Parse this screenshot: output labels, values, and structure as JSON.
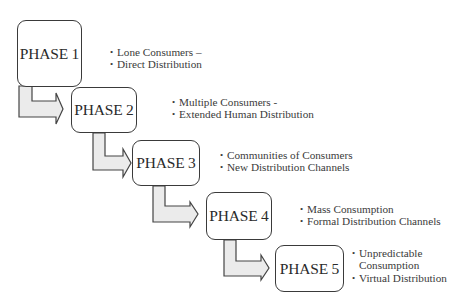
{
  "diagram": {
    "type": "staircase-process",
    "colors": {
      "box_border": "#3a3a3a",
      "box_fill": "#ffffff",
      "arrow_fill": "#ebebeb",
      "arrow_border": "#444444",
      "text": "#333333"
    },
    "phases": [
      {
        "label": "PHASE 1",
        "bullets": [
          "Lone Consumers –",
          "Direct Distribution"
        ]
      },
      {
        "label": "PHASE 2",
        "bullets": [
          "Multiple Consumers -",
          "Extended Human  Distribution"
        ]
      },
      {
        "label": "PHASE 3",
        "bullets": [
          "Communities of Consumers",
          "New Distribution Channels"
        ]
      },
      {
        "label": "PHASE 4",
        "bullets": [
          "Mass Consumption",
          "Formal Distribution Channels"
        ]
      },
      {
        "label": "PHASE 5",
        "bullets": [
          "Unpredictable Consumption",
          "Virtual Distribution"
        ]
      }
    ],
    "connectors": [
      {
        "from": "PHASE 1",
        "to": "PHASE 2",
        "shape": "bent-arrow"
      },
      {
        "from": "PHASE 2",
        "to": "PHASE 3",
        "shape": "bent-arrow"
      },
      {
        "from": "PHASE 3",
        "to": "PHASE 4",
        "shape": "bent-arrow"
      },
      {
        "from": "PHASE 4",
        "to": "PHASE 5",
        "shape": "bent-arrow"
      }
    ]
  }
}
